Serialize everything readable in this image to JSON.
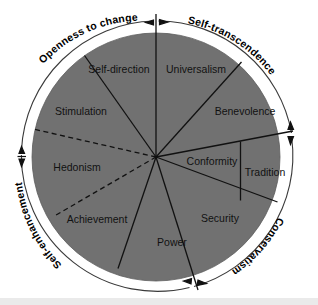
{
  "figure": {
    "center": {
      "x": 156,
      "y": 157
    },
    "disc_radius": 124,
    "ring_radius": 136,
    "colors": {
      "disc_fill": "#717171",
      "line": "#111111",
      "background": "#ffffff",
      "label_text": "#111111"
    }
  },
  "higher_order_dimensions": [
    {
      "id": "openness-to-change",
      "label": "Openness to change",
      "position": "upper-left"
    },
    {
      "id": "self-transcendence",
      "label": "Self-transcendence",
      "position": "upper-right"
    },
    {
      "id": "conservatism",
      "label": "Conservatism",
      "position": "lower-right"
    },
    {
      "id": "self-enhancement",
      "label": "Self-enhancement",
      "position": "lower-left"
    }
  ],
  "value_sectors": [
    {
      "id": "self-direction",
      "label": "Self-direction",
      "x": 119,
      "y": 70,
      "anchor": "middle"
    },
    {
      "id": "universalism",
      "label": "Universalism",
      "x": 196,
      "y": 70,
      "anchor": "middle"
    },
    {
      "id": "benevolence",
      "label": "Benevolence",
      "x": 245,
      "y": 112,
      "anchor": "middle"
    },
    {
      "id": "stimulation",
      "label": "Stimulation",
      "x": 81,
      "y": 112,
      "anchor": "middle"
    },
    {
      "id": "conformity",
      "label": "Conformity",
      "x": 212,
      "y": 162,
      "anchor": "middle"
    },
    {
      "id": "tradition",
      "label": "Tradition",
      "x": 265,
      "y": 173,
      "anchor": "middle"
    },
    {
      "id": "hedonism",
      "label": "Hedonism",
      "x": 77,
      "y": 168,
      "anchor": "middle"
    },
    {
      "id": "achievement",
      "label": "Achievement",
      "x": 97,
      "y": 220,
      "anchor": "middle"
    },
    {
      "id": "security",
      "label": "Security",
      "x": 220,
      "y": 219,
      "anchor": "middle"
    },
    {
      "id": "power",
      "label": "Power",
      "x": 172,
      "y": 243,
      "anchor": "middle"
    }
  ]
}
